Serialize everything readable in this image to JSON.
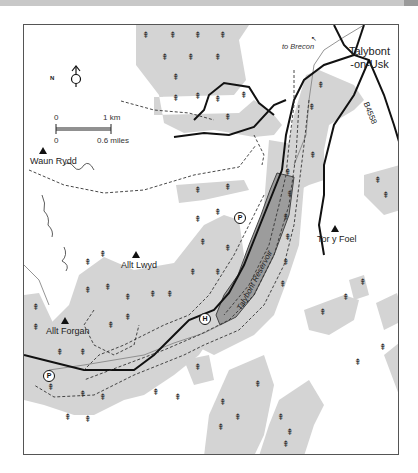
{
  "map": {
    "settlement": {
      "label": "Talybont\n-on-Usk",
      "line1": "Talybont",
      "line2": "-on-Usk"
    },
    "road_label": "B4558",
    "direction_label": "to Brecon",
    "reservoir_label": "Talybont Reservoir",
    "hills": [
      {
        "name": "Waun Rydd"
      },
      {
        "name": "Allt Lwyd"
      },
      {
        "name": "Allt Forgan"
      },
      {
        "name": "Tor y Foel"
      }
    ],
    "markers": [
      {
        "type": "parking",
        "symbol": "P"
      },
      {
        "type": "parking",
        "symbol": "P"
      },
      {
        "type": "hostel",
        "symbol": "H"
      }
    ],
    "north_arrow": {
      "symbol": "N"
    },
    "scale_bar": {
      "top_start": "0",
      "top_end": "1 km",
      "bottom_start": "0",
      "bottom_end": "0.6 miles"
    },
    "colors": {
      "woodland": "#d4d4d4",
      "reservoir": "#9c9c9c",
      "road": "#111111",
      "border": "#555555",
      "background": "#ffffff"
    }
  }
}
